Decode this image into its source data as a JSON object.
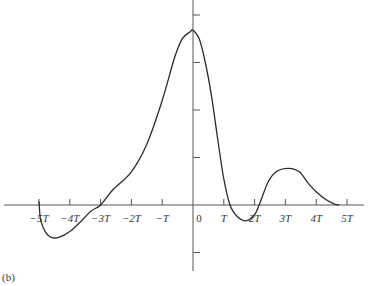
{
  "chart_data": {
    "type": "line",
    "title": "",
    "caption": "(b)",
    "xlabel": "",
    "ylabel": "",
    "x_unit": "T",
    "xlim": [
      -5.3,
      5.3
    ],
    "ylim": [
      -1.35,
      4.35
    ],
    "grid": false,
    "legend": "none",
    "x_ticks": [
      -5,
      -4,
      -3,
      -2,
      -1,
      0,
      1,
      2,
      3,
      4,
      5
    ],
    "x_tick_labels": [
      "−5T",
      "−4T",
      "−3T",
      "−2T",
      "−T",
      "0",
      "T",
      "2T",
      "3T",
      "4T",
      "5T"
    ],
    "y_ticks": [
      -1,
      1,
      2,
      3,
      4
    ],
    "y_tick_labels": [
      "",
      "",
      "",
      "",
      ""
    ],
    "series": [
      {
        "name": "signal",
        "points": [
          [
            -5.0,
            0.08
          ],
          [
            -4.95,
            -0.3
          ],
          [
            -4.8,
            -0.56
          ],
          [
            -4.6,
            -0.68
          ],
          [
            -4.35,
            -0.68
          ],
          [
            -4.0,
            -0.56
          ],
          [
            -3.6,
            -0.32
          ],
          [
            -3.3,
            -0.12
          ],
          [
            -3.0,
            0.0
          ],
          [
            -2.6,
            0.32
          ],
          [
            -2.0,
            0.7
          ],
          [
            -1.5,
            1.28
          ],
          [
            -1.0,
            2.2
          ],
          [
            -0.6,
            3.1
          ],
          [
            -0.35,
            3.5
          ],
          [
            -0.1,
            3.64
          ],
          [
            0.0,
            3.68
          ],
          [
            0.2,
            3.5
          ],
          [
            0.4,
            3.0
          ],
          [
            0.6,
            2.3
          ],
          [
            0.8,
            1.4
          ],
          [
            1.0,
            0.55
          ],
          [
            1.2,
            0.0
          ],
          [
            1.45,
            -0.25
          ],
          [
            1.75,
            -0.33
          ],
          [
            2.0,
            -0.2
          ],
          [
            2.15,
            0.0
          ],
          [
            2.45,
            0.5
          ],
          [
            2.75,
            0.72
          ],
          [
            3.1,
            0.77
          ],
          [
            3.45,
            0.7
          ],
          [
            3.75,
            0.45
          ],
          [
            4.0,
            0.28
          ],
          [
            4.3,
            0.12
          ],
          [
            4.6,
            0.02
          ],
          [
            4.75,
            0.0
          ]
        ]
      }
    ]
  }
}
